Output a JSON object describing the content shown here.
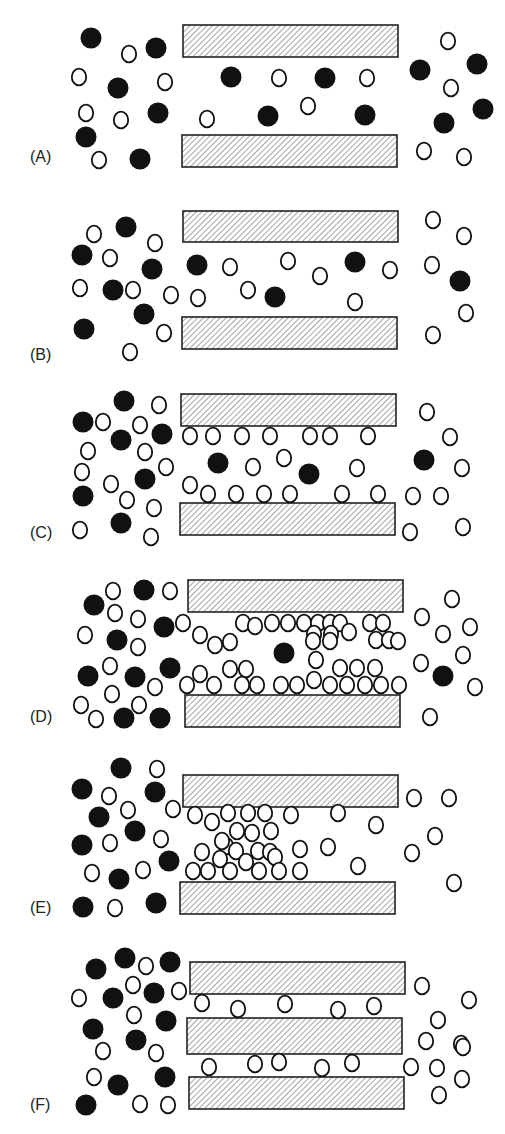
{
  "figure": {
    "colors": {
      "filled_particle": "#111111",
      "open_particle_stroke": "#111111",
      "plate_hatch": "#555555",
      "plate_border": "#222222",
      "background": "#ffffff"
    },
    "panels": [
      {
        "label": "(A)",
        "label_pos": [
          30,
          162
        ],
        "plates": [
          [
            183,
            25,
            215,
            32
          ],
          [
            182,
            135,
            215,
            32
          ]
        ],
        "filled": [
          [
            91,
            38
          ],
          [
            156,
            48
          ],
          [
            231,
            77
          ],
          [
            325,
            78
          ],
          [
            118,
            88
          ],
          [
            158,
            113
          ],
          [
            268,
            116
          ],
          [
            365,
            115
          ],
          [
            86,
            137
          ],
          [
            140,
            159
          ],
          [
            420,
            70
          ],
          [
            477,
            64
          ],
          [
            444,
            123
          ],
          [
            483,
            109
          ]
        ],
        "open": [
          [
            129,
            54
          ],
          [
            79,
            77
          ],
          [
            165,
            82
          ],
          [
            279,
            78
          ],
          [
            367,
            78
          ],
          [
            86,
            113
          ],
          [
            121,
            120
          ],
          [
            207,
            119
          ],
          [
            308,
            106
          ],
          [
            99,
            160
          ],
          [
            448,
            41
          ],
          [
            451,
            88
          ],
          [
            424,
            151
          ],
          [
            464,
            157
          ]
        ]
      },
      {
        "label": "(B)",
        "label_pos": [
          30,
          360
        ],
        "plates": [
          [
            183,
            211,
            215,
            31
          ],
          [
            182,
            317,
            215,
            32
          ]
        ],
        "filled": [
          [
            126,
            227
          ],
          [
            82,
            255
          ],
          [
            152,
            269
          ],
          [
            197,
            265
          ],
          [
            355,
            262
          ],
          [
            113,
            290
          ],
          [
            275,
            297
          ],
          [
            144,
            314
          ],
          [
            84,
            329
          ],
          [
            460,
            281
          ]
        ],
        "open": [
          [
            94,
            234
          ],
          [
            155,
            243
          ],
          [
            110,
            258
          ],
          [
            230,
            267
          ],
          [
            288,
            261
          ],
          [
            320,
            276
          ],
          [
            80,
            288
          ],
          [
            133,
            290
          ],
          [
            171,
            295
          ],
          [
            198,
            298
          ],
          [
            248,
            290
          ],
          [
            390,
            270
          ],
          [
            432,
            265
          ],
          [
            464,
            236
          ],
          [
            433,
            220
          ],
          [
            355,
            302
          ],
          [
            466,
            313
          ],
          [
            164,
            333
          ],
          [
            130,
            352
          ],
          [
            433,
            335
          ]
        ]
      },
      {
        "label": "(C)",
        "label_pos": [
          30,
          538
        ],
        "plates": [
          [
            181,
            394,
            215,
            32
          ],
          [
            180,
            503,
            215,
            32
          ]
        ],
        "filled": [
          [
            124,
            401
          ],
          [
            83,
            422
          ],
          [
            121,
            440
          ],
          [
            162,
            434
          ],
          [
            218,
            463
          ],
          [
            309,
            474
          ],
          [
            145,
            479
          ],
          [
            83,
            496
          ],
          [
            121,
            523
          ],
          [
            424,
            460
          ]
        ],
        "open": [
          [
            159,
            405
          ],
          [
            103,
            422
          ],
          [
            140,
            425
          ],
          [
            190,
            436
          ],
          [
            213,
            436
          ],
          [
            242,
            436
          ],
          [
            270,
            436
          ],
          [
            310,
            436
          ],
          [
            330,
            436
          ],
          [
            368,
            436
          ],
          [
            88,
            451
          ],
          [
            145,
            452
          ],
          [
            82,
            472
          ],
          [
            111,
            484
          ],
          [
            166,
            467
          ],
          [
            190,
            485
          ],
          [
            253,
            467
          ],
          [
            284,
            458
          ],
          [
            357,
            468
          ],
          [
            462,
            468
          ],
          [
            427,
            412
          ],
          [
            450,
            437
          ],
          [
            208,
            494
          ],
          [
            236,
            494
          ],
          [
            264,
            494
          ],
          [
            290,
            494
          ],
          [
            342,
            494
          ],
          [
            378,
            494
          ],
          [
            413,
            496
          ],
          [
            441,
            496
          ],
          [
            127,
            500
          ],
          [
            154,
            508
          ],
          [
            80,
            530
          ],
          [
            151,
            537
          ],
          [
            410,
            532
          ],
          [
            463,
            527
          ]
        ]
      },
      {
        "label": "(D)",
        "label_pos": [
          30,
          722
        ],
        "plates": [
          [
            188,
            580,
            215,
            32
          ],
          [
            185,
            695,
            215,
            32
          ]
        ],
        "filled": [
          [
            94,
            605
          ],
          [
            144,
            590
          ],
          [
            164,
            627
          ],
          [
            117,
            640
          ],
          [
            284,
            653
          ],
          [
            170,
            668
          ],
          [
            88,
            676
          ],
          [
            135,
            677
          ],
          [
            443,
            676
          ],
          [
            124,
            718
          ],
          [
            160,
            718
          ]
        ],
        "open": [
          [
            113,
            591
          ],
          [
            170,
            591
          ],
          [
            115,
            613
          ],
          [
            138,
            619
          ],
          [
            85,
            635
          ],
          [
            138,
            647
          ],
          [
            183,
            623
          ],
          [
            200,
            635
          ],
          [
            215,
            645
          ],
          [
            230,
            642
          ],
          [
            243,
            623
          ],
          [
            255,
            626
          ],
          [
            272,
            623
          ],
          [
            288,
            623
          ],
          [
            304,
            623
          ],
          [
            318,
            623
          ],
          [
            330,
            623
          ],
          [
            340,
            623
          ],
          [
            370,
            623
          ],
          [
            383,
            623
          ],
          [
            314,
            634
          ],
          [
            331,
            634
          ],
          [
            349,
            632
          ],
          [
            376,
            640
          ],
          [
            389,
            640
          ],
          [
            313,
            641
          ],
          [
            330,
            641
          ],
          [
            398,
            641
          ],
          [
            316,
            660
          ],
          [
            110,
            666
          ],
          [
            230,
            669
          ],
          [
            246,
            669
          ],
          [
            200,
            674
          ],
          [
            340,
            668
          ],
          [
            357,
            668
          ],
          [
            375,
            668
          ],
          [
            187,
            685
          ],
          [
            214,
            685
          ],
          [
            242,
            685
          ],
          [
            257,
            685
          ],
          [
            281,
            685
          ],
          [
            297,
            685
          ],
          [
            314,
            680
          ],
          [
            330,
            685
          ],
          [
            347,
            685
          ],
          [
            365,
            685
          ],
          [
            381,
            685
          ],
          [
            399,
            685
          ],
          [
            155,
            687
          ],
          [
            112,
            694
          ],
          [
            81,
            705
          ],
          [
            139,
            705
          ],
          [
            96,
            719
          ],
          [
            422,
            617
          ],
          [
            443,
            634
          ],
          [
            470,
            627
          ],
          [
            421,
            663
          ],
          [
            463,
            655
          ],
          [
            475,
            687
          ],
          [
            430,
            717
          ],
          [
            452,
            599
          ]
        ]
      },
      {
        "label": "(E)",
        "label_pos": [
          30,
          913
        ],
        "plates": [
          [
            183,
            775,
            215,
            32
          ],
          [
            180,
            882,
            215,
            32
          ]
        ],
        "filled": [
          [
            121,
            768
          ],
          [
            82,
            789
          ],
          [
            155,
            792
          ],
          [
            99,
            817
          ],
          [
            135,
            831
          ],
          [
            82,
            845
          ],
          [
            169,
            861
          ],
          [
            119,
            879
          ],
          [
            83,
            907
          ],
          [
            156,
            903
          ]
        ],
        "open": [
          [
            157,
            769
          ],
          [
            109,
            796
          ],
          [
            128,
            810
          ],
          [
            173,
            809
          ],
          [
            195,
            815
          ],
          [
            212,
            822
          ],
          [
            228,
            813
          ],
          [
            248,
            813
          ],
          [
            265,
            813
          ],
          [
            291,
            815
          ],
          [
            338,
            813
          ],
          [
            226,
            846
          ],
          [
            237,
            831
          ],
          [
            252,
            833
          ],
          [
            271,
            831
          ],
          [
            222,
            841
          ],
          [
            236,
            851
          ],
          [
            258,
            851
          ],
          [
            270,
            852
          ],
          [
            202,
            852
          ],
          [
            220,
            859
          ],
          [
            246,
            862
          ],
          [
            275,
            857
          ],
          [
            208,
            871
          ],
          [
            193,
            871
          ],
          [
            230,
            871
          ],
          [
            259,
            871
          ],
          [
            279,
            871
          ],
          [
            300,
            871
          ],
          [
            110,
            843
          ],
          [
            92,
            873
          ],
          [
            143,
            870
          ],
          [
            161,
            839
          ],
          [
            300,
            849
          ],
          [
            328,
            847
          ],
          [
            358,
            866
          ],
          [
            376,
            825
          ],
          [
            414,
            798
          ],
          [
            449,
            798
          ],
          [
            435,
            836
          ],
          [
            412,
            853
          ],
          [
            454,
            883
          ],
          [
            115,
            908
          ]
        ]
      },
      {
        "label": "(F)",
        "label_pos": [
          30,
          1110
        ],
        "plates": [
          [
            190,
            962,
            215,
            32
          ],
          [
            187,
            1018,
            215,
            36
          ],
          [
            189,
            1077,
            215,
            32
          ]
        ],
        "filled": [
          [
            96,
            969
          ],
          [
            125,
            958
          ],
          [
            170,
            962
          ],
          [
            113,
            998
          ],
          [
            154,
            993
          ],
          [
            93,
            1029
          ],
          [
            136,
            1040
          ],
          [
            166,
            1021
          ],
          [
            118,
            1085
          ],
          [
            165,
            1077
          ],
          [
            86,
            1105
          ]
        ],
        "open": [
          [
            146,
            966
          ],
          [
            133,
            985
          ],
          [
            79,
            998
          ],
          [
            179,
            991
          ],
          [
            134,
            1015
          ],
          [
            103,
            1051
          ],
          [
            156,
            1053
          ],
          [
            94,
            1077
          ],
          [
            140,
            1104
          ],
          [
            168,
            1105
          ],
          [
            202,
            1003
          ],
          [
            238,
            1009
          ],
          [
            285,
            1004
          ],
          [
            338,
            1010
          ],
          [
            374,
            1006
          ],
          [
            209,
            1067
          ],
          [
            255,
            1064
          ],
          [
            279,
            1062
          ],
          [
            322,
            1068
          ],
          [
            352,
            1063
          ],
          [
            422,
            986
          ],
          [
            469,
            1000
          ],
          [
            438,
            1020
          ],
          [
            426,
            1041
          ],
          [
            461,
            1044
          ],
          [
            411,
            1067
          ],
          [
            437,
            1068
          ],
          [
            462,
            1079
          ],
          [
            439,
            1095
          ],
          [
            463,
            1047
          ]
        ]
      }
    ]
  }
}
